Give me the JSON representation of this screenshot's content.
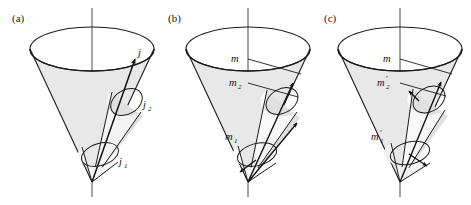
{
  "figure": {
    "background": "#ffffff",
    "stroke_color": "#1a1a1a",
    "cone_fill": "#e8e8e8",
    "small_cone_fill": "#ffffff",
    "width": 471,
    "height": 205
  },
  "panels": [
    {
      "id": "a",
      "label": "(a)",
      "labels": [
        {
          "name": "j",
          "base": "j",
          "sub": "",
          "prime": false
        },
        {
          "name": "j2",
          "base": "j",
          "sub": "2",
          "prime": false
        },
        {
          "name": "j1",
          "base": "j",
          "sub": "1",
          "prime": false
        }
      ]
    },
    {
      "id": "b",
      "label": "(b)",
      "labels": [
        {
          "name": "m",
          "base": "m",
          "sub": "",
          "prime": false
        },
        {
          "name": "m2",
          "base": "m",
          "sub": "2",
          "prime": false
        },
        {
          "name": "m1",
          "base": "m",
          "sub": "1",
          "prime": false
        }
      ]
    },
    {
      "id": "c",
      "label": "(c)",
      "labels": [
        {
          "name": "m",
          "base": "m",
          "sub": "",
          "prime": false
        },
        {
          "name": "m2prime",
          "base": "m",
          "sub": "2",
          "prime": true
        },
        {
          "name": "m1prime",
          "base": "m",
          "sub": "1",
          "prime": true
        }
      ]
    }
  ],
  "panel_a": {
    "label": "(a)",
    "j_label": "j",
    "j2_base": "j",
    "j2_sub": "2",
    "j1_base": "j",
    "j1_sub": "1"
  },
  "panel_b": {
    "label": "(b)",
    "m_label": "m",
    "m2_base": "m",
    "m2_sub": "2",
    "m1_base": "m",
    "m1_sub": "1"
  },
  "panel_c": {
    "label": "(c)",
    "m_label": "m",
    "m2_base": "m",
    "m2_sub": "2",
    "m2_prime": "′",
    "m1_base": "m",
    "m1_sub": "1",
    "m1_prime": "′"
  }
}
